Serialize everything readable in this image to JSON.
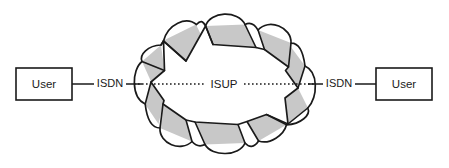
{
  "diagram": {
    "type": "network-topology",
    "background_color": "#ffffff",
    "line_color": "#1a1a1a",
    "cloud": {
      "name": "signalling-network-cloud",
      "shape": "scalloped-starburst-cloud",
      "fill_white": "#ffffff",
      "fill_shadow": "#c8c8c8",
      "outline_color": "#1a1a1a",
      "lobes": 10,
      "center_x": 224.5,
      "center_y": 84,
      "outer_radius_x": 94,
      "outer_radius_y": 84,
      "inner_radius_x": 62,
      "inner_radius_y": 55
    },
    "nodes": [
      {
        "id": "user-left",
        "label": "User",
        "x": 16,
        "y": 68,
        "width": 56,
        "height": 32
      },
      {
        "id": "user-right",
        "label": "User",
        "x": 376,
        "y": 68,
        "width": 56,
        "height": 32
      }
    ],
    "links": [
      {
        "id": "isdn-left",
        "label": "ISDN",
        "style": "solid",
        "label_x": 110,
        "label_y": 84,
        "segments": [
          {
            "x1": 72,
            "y1": 84,
            "x2": 94,
            "y2": 84
          },
          {
            "x1": 126,
            "y1": 84,
            "x2": 140,
            "y2": 84
          }
        ]
      },
      {
        "id": "isup-core",
        "label": "ISUP",
        "style": "dotted",
        "label_x": 224,
        "label_y": 84,
        "segments": [
          {
            "x1": 134,
            "y1": 84,
            "x2": 206,
            "y2": 84
          },
          {
            "x1": 243,
            "y1": 84,
            "x2": 316,
            "y2": 84
          }
        ]
      },
      {
        "id": "isdn-right",
        "label": "ISDN",
        "style": "solid",
        "label_x": 339,
        "label_y": 84,
        "segments": [
          {
            "x1": 310,
            "y1": 84,
            "x2": 323,
            "y2": 84
          },
          {
            "x1": 355,
            "y1": 84,
            "x2": 376,
            "y2": 84
          }
        ]
      }
    ]
  }
}
